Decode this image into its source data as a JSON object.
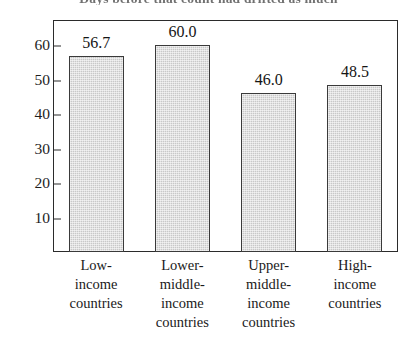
{
  "caption": {
    "clipped_text": "Days before that count had drifted as much"
  },
  "chart_data": {
    "type": "bar",
    "title": "",
    "xlabel": "",
    "ylabel": "",
    "categories": [
      "Low-income countries",
      "Lower-middle-income countries",
      "Upper-middle-income countries",
      "High-income countries"
    ],
    "category_lines": [
      [
        "Low-",
        "income",
        "countries"
      ],
      [
        "Lower-",
        "middle-",
        "income",
        "countries"
      ],
      [
        "Upper-",
        "middle-",
        "income",
        "countries"
      ],
      [
        "High-",
        "income",
        "countries"
      ]
    ],
    "values": [
      56.7,
      60.0,
      46.0,
      48.5
    ],
    "value_labels": [
      "56.7",
      "60.0",
      "46.0",
      "48.5"
    ],
    "ylim": [
      0,
      67
    ],
    "yticks": [
      10,
      20,
      30,
      40,
      50,
      60
    ],
    "ytick_labels": [
      "10",
      "20",
      "30",
      "40",
      "50",
      "60"
    ],
    "grid": false,
    "legend": false,
    "bar_fill_color": "#c8c8c8",
    "bar_edge_color": "#3a3a3a",
    "axis_color": "#2b2b2b",
    "background_color": "#ffffff"
  }
}
